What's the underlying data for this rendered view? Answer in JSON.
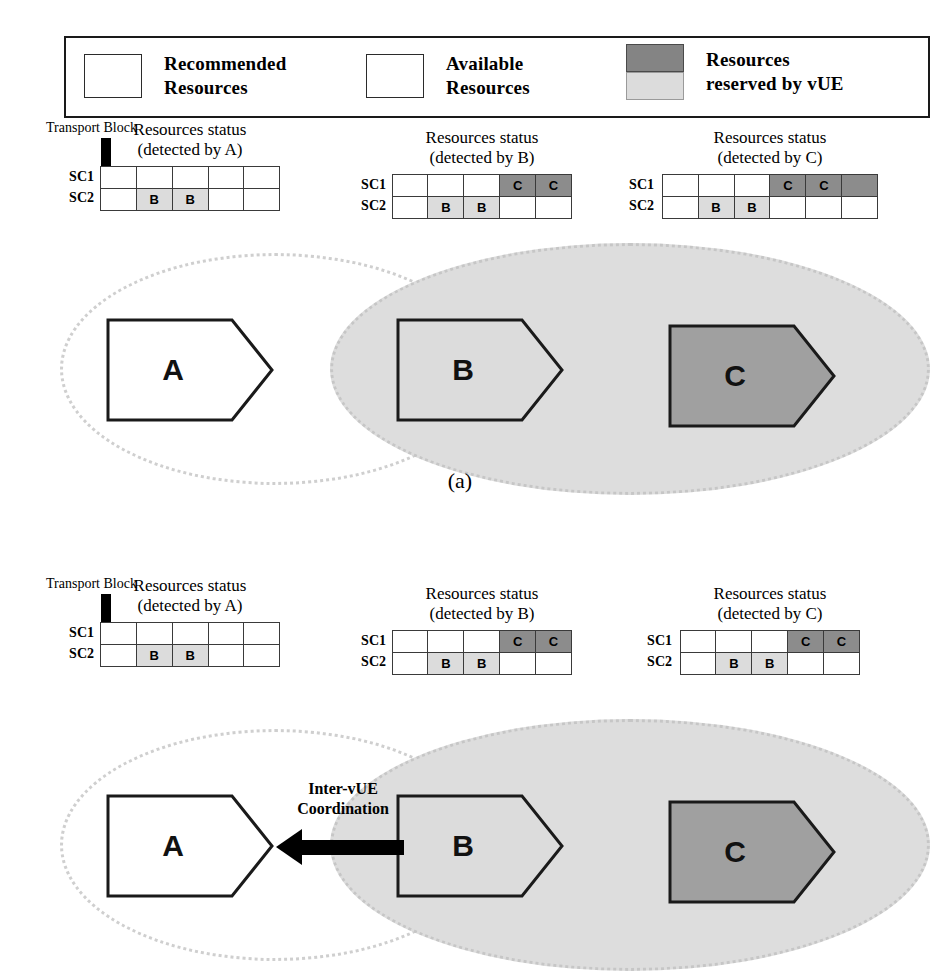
{
  "legend": {
    "items": [
      {
        "swatch": "outline-box",
        "line1": "Recommended",
        "line2": "Resources"
      },
      {
        "swatch": "outline-box",
        "line1": "Available",
        "line2": "Resources"
      },
      {
        "swatch": "gray-stack",
        "line1": "Resources",
        "line2": "reserved by vUE"
      }
    ]
  },
  "colors": {
    "reserved_dark": "#8c8c8c",
    "reserved_light": "#dcdcdc",
    "ellipse_fill": "#dddddd",
    "vehicle_c_fill": "#a0a0a0",
    "vehicle_b_fill": "#dcdcdc",
    "vehicle_a_fill": "#ffffff",
    "border": "#1a1a1a"
  },
  "panel_a": {
    "caption": "(a)",
    "transport_block": {
      "label": "Transport Block"
    },
    "tables": [
      {
        "title_line1": "Resources status",
        "title_line2": "(detected by A)",
        "row_labels": [
          "SC1",
          "SC2"
        ],
        "columns": 5,
        "rows": [
          [
            {
              "text": "",
              "fill": "white"
            },
            {
              "text": "",
              "fill": "white"
            },
            {
              "text": "",
              "fill": "white"
            },
            {
              "text": "",
              "fill": "white"
            },
            {
              "text": "",
              "fill": "white"
            }
          ],
          [
            {
              "text": "",
              "fill": "white"
            },
            {
              "text": "B",
              "fill": "light"
            },
            {
              "text": "B",
              "fill": "light"
            },
            {
              "text": "",
              "fill": "white"
            },
            {
              "text": "",
              "fill": "white"
            }
          ]
        ]
      },
      {
        "title_line1": "Resources status",
        "title_line2": "(detected by B)",
        "row_labels": [
          "SC1",
          "SC2"
        ],
        "columns": 5,
        "rows": [
          [
            {
              "text": "",
              "fill": "white"
            },
            {
              "text": "",
              "fill": "white"
            },
            {
              "text": "",
              "fill": "white"
            },
            {
              "text": "C",
              "fill": "dark"
            },
            {
              "text": "C",
              "fill": "dark"
            }
          ],
          [
            {
              "text": "",
              "fill": "white"
            },
            {
              "text": "B",
              "fill": "light"
            },
            {
              "text": "B",
              "fill": "light"
            },
            {
              "text": "",
              "fill": "white"
            },
            {
              "text": "",
              "fill": "white"
            }
          ]
        ]
      },
      {
        "title_line1": "Resources status",
        "title_line2": "(detected by C)",
        "row_labels": [
          "SC1",
          "SC2"
        ],
        "columns": 6,
        "rows": [
          [
            {
              "text": "",
              "fill": "white"
            },
            {
              "text": "",
              "fill": "white"
            },
            {
              "text": "",
              "fill": "white"
            },
            {
              "text": "C",
              "fill": "dark"
            },
            {
              "text": "C",
              "fill": "dark"
            },
            {
              "text": "",
              "fill": "dark"
            }
          ],
          [
            {
              "text": "",
              "fill": "white"
            },
            {
              "text": "B",
              "fill": "light"
            },
            {
              "text": "B",
              "fill": "light"
            },
            {
              "text": "",
              "fill": "white"
            },
            {
              "text": "",
              "fill": "white"
            },
            {
              "text": "",
              "fill": "white"
            }
          ]
        ]
      }
    ],
    "vehicles": [
      {
        "label": "A",
        "fill": "white"
      },
      {
        "label": "B",
        "fill": "light"
      },
      {
        "label": "C",
        "fill": "dark"
      }
    ]
  },
  "panel_b": {
    "transport_block": {
      "label": "Transport Block"
    },
    "coordination": {
      "line1": "Inter-vUE",
      "line2": "Coordination"
    },
    "tables": [
      {
        "title_line1": "Resources status",
        "title_line2": "(detected by A)",
        "row_labels": [
          "SC1",
          "SC2"
        ],
        "columns": 5,
        "rows": [
          [
            {
              "text": "",
              "fill": "white"
            },
            {
              "text": "",
              "fill": "white"
            },
            {
              "text": "",
              "fill": "white"
            },
            {
              "text": "",
              "fill": "white"
            },
            {
              "text": "",
              "fill": "white"
            }
          ],
          [
            {
              "text": "",
              "fill": "white"
            },
            {
              "text": "B",
              "fill": "light"
            },
            {
              "text": "B",
              "fill": "light"
            },
            {
              "text": "",
              "fill": "white"
            },
            {
              "text": "",
              "fill": "white"
            }
          ]
        ]
      },
      {
        "title_line1": "Resources status",
        "title_line2": "(detected by B)",
        "row_labels": [
          "SC1",
          "SC2"
        ],
        "columns": 5,
        "rows": [
          [
            {
              "text": "",
              "fill": "white"
            },
            {
              "text": "",
              "fill": "white"
            },
            {
              "text": "",
              "fill": "white"
            },
            {
              "text": "C",
              "fill": "dark"
            },
            {
              "text": "C",
              "fill": "dark"
            }
          ],
          [
            {
              "text": "",
              "fill": "white"
            },
            {
              "text": "B",
              "fill": "light"
            },
            {
              "text": "B",
              "fill": "light"
            },
            {
              "text": "",
              "fill": "white"
            },
            {
              "text": "",
              "fill": "white"
            }
          ]
        ]
      },
      {
        "title_line1": "Resources status",
        "title_line2": "(detected by C)",
        "row_labels": [
          "SC1",
          "SC2"
        ],
        "columns": 5,
        "rows": [
          [
            {
              "text": "",
              "fill": "white"
            },
            {
              "text": "",
              "fill": "white"
            },
            {
              "text": "",
              "fill": "white"
            },
            {
              "text": "C",
              "fill": "dark"
            },
            {
              "text": "C",
              "fill": "dark"
            }
          ],
          [
            {
              "text": "",
              "fill": "white"
            },
            {
              "text": "B",
              "fill": "light"
            },
            {
              "text": "B",
              "fill": "light"
            },
            {
              "text": "",
              "fill": "white"
            },
            {
              "text": "",
              "fill": "white"
            }
          ]
        ]
      }
    ],
    "vehicles": [
      {
        "label": "A",
        "fill": "white"
      },
      {
        "label": "B",
        "fill": "light"
      },
      {
        "label": "C",
        "fill": "dark"
      }
    ]
  }
}
